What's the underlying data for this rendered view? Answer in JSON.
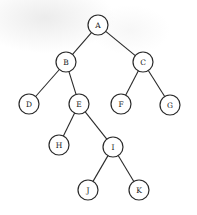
{
  "diagram": {
    "type": "binary-tree",
    "node_radius": 10,
    "colors": {
      "stroke": "#2a2a2a",
      "fill": "#ffffff",
      "text": "#222222"
    },
    "nodes": [
      {
        "id": "A",
        "label": "A",
        "x": 98,
        "y": 25
      },
      {
        "id": "B",
        "label": "B",
        "x": 66,
        "y": 62
      },
      {
        "id": "C",
        "label": "C",
        "x": 143,
        "y": 62
      },
      {
        "id": "D",
        "label": "D",
        "x": 29,
        "y": 104
      },
      {
        "id": "E",
        "label": "E",
        "x": 79,
        "y": 104
      },
      {
        "id": "F",
        "label": "F",
        "x": 121,
        "y": 104
      },
      {
        "id": "G",
        "label": "G",
        "x": 170,
        "y": 105
      },
      {
        "id": "H",
        "label": "H",
        "x": 59,
        "y": 145
      },
      {
        "id": "I",
        "label": "I",
        "x": 113,
        "y": 147
      },
      {
        "id": "J",
        "label": "J",
        "x": 88,
        "y": 190
      },
      {
        "id": "K",
        "label": "K",
        "x": 139,
        "y": 190
      }
    ],
    "edges": [
      {
        "from": "A",
        "to": "B"
      },
      {
        "from": "A",
        "to": "C"
      },
      {
        "from": "B",
        "to": "D"
      },
      {
        "from": "B",
        "to": "E"
      },
      {
        "from": "C",
        "to": "F"
      },
      {
        "from": "C",
        "to": "G"
      },
      {
        "from": "E",
        "to": "H"
      },
      {
        "from": "E",
        "to": "I"
      },
      {
        "from": "I",
        "to": "J"
      },
      {
        "from": "I",
        "to": "K"
      }
    ]
  }
}
